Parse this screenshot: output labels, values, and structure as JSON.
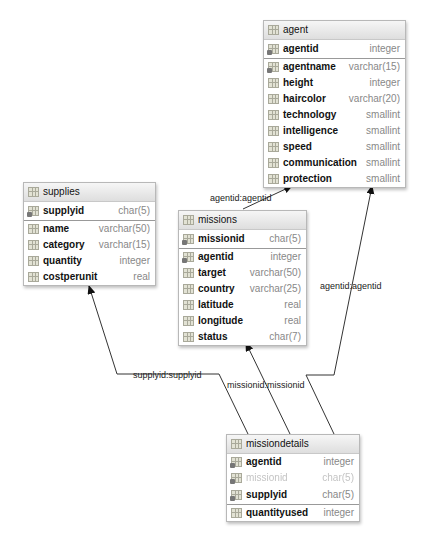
{
  "tables": {
    "agent": {
      "name": "agent",
      "columns": [
        {
          "name": "agentid",
          "type": "integer",
          "key": true
        },
        {
          "name": "agentname",
          "type": "varchar(15)",
          "key": true
        },
        {
          "name": "height",
          "type": "integer"
        },
        {
          "name": "haircolor",
          "type": "varchar(20)"
        },
        {
          "name": "technology",
          "type": "smallint"
        },
        {
          "name": "intelligence",
          "type": "smallint"
        },
        {
          "name": "speed",
          "type": "smallint"
        },
        {
          "name": "communication",
          "type": "smallint"
        },
        {
          "name": "protection",
          "type": "smallint"
        }
      ]
    },
    "supplies": {
      "name": "supplies",
      "columns": [
        {
          "name": "supplyid",
          "type": "char(5)",
          "key": true
        },
        {
          "name": "name",
          "type": "varchar(50)"
        },
        {
          "name": "category",
          "type": "varchar(15)"
        },
        {
          "name": "quantity",
          "type": "integer"
        },
        {
          "name": "costperunit",
          "type": "real"
        }
      ]
    },
    "missions": {
      "name": "missions",
      "columns": [
        {
          "name": "missionid",
          "type": "char(5)",
          "key": true
        },
        {
          "name": "agentid",
          "type": "integer",
          "key": true
        },
        {
          "name": "target",
          "type": "varchar(50)"
        },
        {
          "name": "country",
          "type": "varchar(25)"
        },
        {
          "name": "latitude",
          "type": "real"
        },
        {
          "name": "longitude",
          "type": "real"
        },
        {
          "name": "status",
          "type": "char(7)"
        }
      ]
    },
    "missiondetails": {
      "name": "missiondetails",
      "columns": [
        {
          "name": "agentid",
          "type": "integer",
          "key": true
        },
        {
          "name": "missionid",
          "type": "char(5)",
          "key": true,
          "faded": true
        },
        {
          "name": "supplyid",
          "type": "char(5)",
          "key": true
        },
        {
          "name": "quantityused",
          "type": "integer"
        }
      ]
    }
  },
  "links": {
    "missions_agent": "agentid:agentid",
    "missiondetails_agent": "agentid:agentid",
    "missiondetails_supplies": "supplyid:supplyid",
    "missiondetails_missions": "missionid:missionid"
  },
  "colors": {
    "line": "#333333",
    "border": "#b8b8b8",
    "type_text": "#888888"
  }
}
